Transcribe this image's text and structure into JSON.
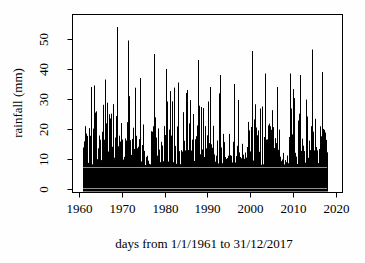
{
  "page": {
    "background_color": "#fefefe",
    "foreground_color": "#000000"
  },
  "chart_data": {
    "type": "bar",
    "subtype": "high-density-daily-vertical-lines",
    "title": "",
    "xlabel": "days from 1/1/1961 to 31/12/2017",
    "ylabel": "rainfall (mm)",
    "x_tick_labels": [
      "1960",
      "1970",
      "1980",
      "1990",
      "2000",
      "2010",
      "2020"
    ],
    "x_tick_years": [
      1960,
      1970,
      1980,
      1990,
      2000,
      2010,
      2020
    ],
    "y_tick_labels": [
      "0",
      "10",
      "20",
      "30",
      "40",
      "50"
    ],
    "y_tick_values": [
      0,
      10,
      20,
      30,
      40,
      50
    ],
    "y_tick_labels_rotated": true,
    "data_start_year": 1961,
    "data_end_year": 2018,
    "ylim": [
      0,
      54
    ],
    "grid": false,
    "legend": null,
    "axis_color": "#000000",
    "series_color": "#000000",
    "artifact_line_color": "#b4b4b4",
    "artifact_lines_mm": [
      7.2,
      0.2
    ],
    "background_noise": {
      "seed": 19612017,
      "solid_black_below_mm": 8,
      "p_low": 0.4,
      "low_range_mm": [
        8,
        13
      ],
      "p_mid": 0.4,
      "mid_range_mm": [
        13,
        22
      ],
      "p_high": 0.17,
      "high_range_mm": [
        22,
        30
      ],
      "p_tall": 0.03,
      "tall_range_mm": [
        30,
        34
      ]
    },
    "notable_peaks": [
      {
        "year": 1962.7,
        "mm": 34.0
      },
      {
        "year": 1963.4,
        "mm": 34.5
      },
      {
        "year": 1966.1,
        "mm": 36.5
      },
      {
        "year": 1968.9,
        "mm": 54.0
      },
      {
        "year": 1971.5,
        "mm": 49.5
      },
      {
        "year": 1974.3,
        "mm": 37.0
      },
      {
        "year": 1977.5,
        "mm": 45.0
      },
      {
        "year": 1980.3,
        "mm": 40.0
      },
      {
        "year": 1983.0,
        "mm": 35.5
      },
      {
        "year": 1985.2,
        "mm": 33.0
      },
      {
        "year": 1987.8,
        "mm": 43.0
      },
      {
        "year": 1990.5,
        "mm": 34.0
      },
      {
        "year": 1993.0,
        "mm": 38.0
      },
      {
        "year": 1996.3,
        "mm": 35.0
      },
      {
        "year": 2000.4,
        "mm": 46.0
      },
      {
        "year": 2003.5,
        "mm": 38.5
      },
      {
        "year": 2006.2,
        "mm": 34.0
      },
      {
        "year": 2009.3,
        "mm": 38.5
      },
      {
        "year": 2011.6,
        "mm": 38.0
      },
      {
        "year": 2014.4,
        "mm": 46.5
      },
      {
        "year": 2016.8,
        "mm": 39.0
      }
    ]
  }
}
